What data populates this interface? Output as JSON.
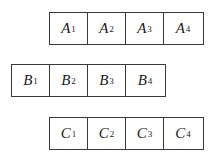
{
  "diagram": {
    "rows": [
      {
        "id": "A",
        "cells": [
          {
            "letter": "A",
            "index": "1"
          },
          {
            "letter": "A",
            "index": "2"
          },
          {
            "letter": "A",
            "index": "3"
          },
          {
            "letter": "A",
            "index": "4"
          }
        ]
      },
      {
        "id": "B",
        "cells": [
          {
            "letter": "B",
            "index": "1"
          },
          {
            "letter": "B",
            "index": "2"
          },
          {
            "letter": "B",
            "index": "3"
          },
          {
            "letter": "B",
            "index": "4"
          }
        ]
      },
      {
        "id": "C",
        "cells": [
          {
            "letter": "C",
            "index": "1"
          },
          {
            "letter": "C",
            "index": "2"
          },
          {
            "letter": "C",
            "index": "3"
          },
          {
            "letter": "C",
            "index": "4"
          }
        ]
      }
    ],
    "colors": {
      "border": "#3a3a3a",
      "text": "#1a1a1a",
      "background": "#ffffff"
    }
  }
}
